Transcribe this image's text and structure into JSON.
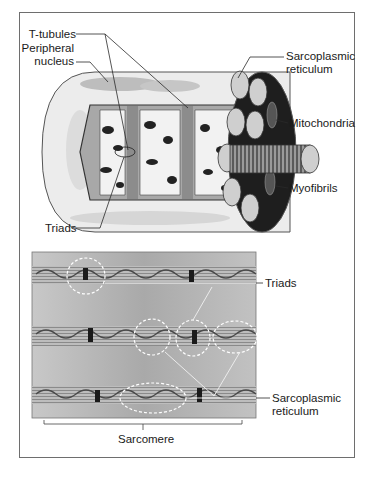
{
  "figure": {
    "top_panel": {
      "name": "Skeletal muscle fiber 3D illustration",
      "labels": {
        "t_tubules": "T-tubules",
        "peripheral_nucleus_line1": "Peripheral",
        "peripheral_nucleus_line2": "nucleus",
        "sarcoplasmic_reticulum_line1": "Sarcoplasmic",
        "sarcoplasmic_reticulum_line2": "reticulum",
        "mitochondria": "Mitochondria",
        "myofibrils": "Myofibrils",
        "triads": "Triads"
      }
    },
    "bottom_panel": {
      "name": "Electron micrograph of muscle fiber",
      "labels": {
        "triads": "Triads",
        "sarcoplasmic_reticulum_line1": "Sarcoplasmic",
        "sarcoplasmic_reticulum_line2": "reticulum",
        "sarcomere": "Sarcomere"
      }
    },
    "colors": {
      "frame": "#6e6e6e",
      "fiber_light": "#d9d9d9",
      "fiber_mid": "#a8a8a8",
      "fiber_dark": "#1e1e1e",
      "micrograph_bg": "#b9b9b9",
      "leader_line": "#2a2a2a"
    }
  }
}
